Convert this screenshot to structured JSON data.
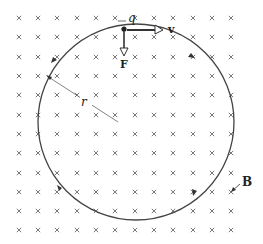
{
  "figure": {
    "labels": {
      "charge": "q",
      "velocity": "v",
      "force": "F",
      "radius": "r",
      "field": "B"
    },
    "field_symbol": "×",
    "field_direction": "into-page",
    "grid": {
      "columns": [
        19,
        38,
        57,
        77,
        96,
        115,
        135,
        154,
        173,
        193,
        212,
        231
      ],
      "rows": [
        18,
        37,
        57,
        76,
        95,
        115,
        134,
        153,
        173,
        192,
        211,
        230
      ]
    },
    "orbit": {
      "center": [
        136,
        122
      ],
      "radius": 98,
      "direction": "clockwise"
    },
    "colors": {
      "line": "#444444",
      "marks": "#6a6a6a",
      "text": "#222222"
    }
  }
}
